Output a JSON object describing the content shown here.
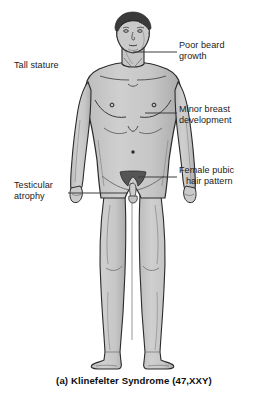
{
  "figure": {
    "caption": "(a) Klinefelter Syndrome (47,XXY)",
    "colors": {
      "background": "#ffffff",
      "skin_fill": "#c8c8c8",
      "skin_shadow": "#a8a8a8",
      "outline": "#2b2b2b",
      "hair": "#3a3a3a",
      "pubic_hair": "#555555",
      "leader_line": "#3c3c3c",
      "text": "#1a1a1a"
    }
  },
  "labels": {
    "tall_stature": {
      "line1": "Tall stature",
      "line2": ""
    },
    "testicular_atrophy": {
      "line1": "Testicular",
      "line2": "atrophy"
    },
    "poor_beard_growth": {
      "line1": "Poor beard",
      "line2": "growth"
    },
    "minor_breast_development": {
      "line1": "Minor breast",
      "line2": "development"
    },
    "female_pubic_hair_pattern": {
      "line1": "Female pubic",
      "line2": "hair pattern"
    }
  }
}
